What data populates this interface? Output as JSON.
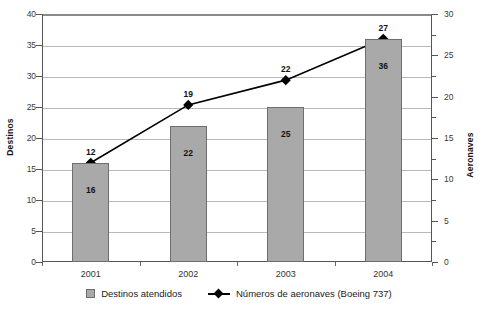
{
  "chart_data": {
    "type": "bar",
    "title": "",
    "xlabel": "",
    "categories": [
      "2001",
      "2002",
      "2003",
      "2004"
    ],
    "grid": true,
    "legend_position": "bottom",
    "series": [
      {
        "name": "Destinos atendidos",
        "type": "bar",
        "axis": "left",
        "values": [
          16,
          22,
          25,
          36
        ],
        "color": "#a9a9a9",
        "border_color": "#6e6e6e"
      },
      {
        "name": "Números de aeronaves (Boeing 737)",
        "type": "line",
        "axis": "right",
        "values": [
          12,
          19,
          22,
          27
        ],
        "color": "#000000",
        "marker": "diamond"
      }
    ],
    "left_axis": {
      "label": "Destinos",
      "ylim": [
        0,
        40
      ],
      "ticks": [
        0,
        5,
        10,
        15,
        20,
        25,
        30,
        35,
        40
      ]
    },
    "right_axis": {
      "label": "Aeronaves",
      "ylim": [
        0,
        30
      ],
      "ticks": [
        0,
        5,
        10,
        15,
        20,
        25,
        30
      ],
      "minor_ticks": [
        2.5,
        7.5,
        12.5,
        17.5,
        22.5,
        27.5
      ]
    }
  },
  "legend": {
    "items": [
      {
        "label": "Destinos atendidos",
        "marker": "square-swatch"
      },
      {
        "label": "Números de aeronaves (Boeing 737)",
        "marker": "diamond-line-swatch"
      }
    ]
  }
}
